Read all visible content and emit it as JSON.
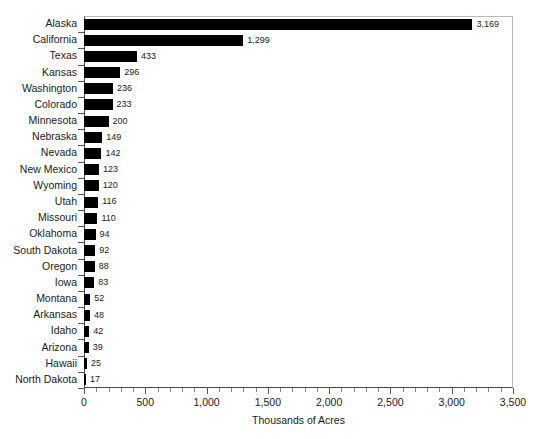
{
  "chart_data": {
    "type": "bar",
    "orientation": "horizontal",
    "title": "",
    "xlabel": "Thousands of Acres",
    "ylabel": "",
    "xlim": [
      0,
      3500
    ],
    "xticks": [
      "0",
      "500",
      "1,000",
      "1,500",
      "2,000",
      "2,500",
      "3,000",
      "3,500"
    ],
    "xtick_values": [
      0,
      500,
      1000,
      1500,
      2000,
      2500,
      3000,
      3500
    ],
    "minor_tick_interval": 100,
    "grid": false,
    "legend": null,
    "bar_color": "#000000",
    "categories": [
      "Alaska",
      "California",
      "Texas",
      "Kansas",
      "Washington",
      "Colorado",
      "Minnesota",
      "Nebraska",
      "Nevada",
      "New Mexico",
      "Wyoming",
      "Utah",
      "Missouri",
      "Oklahoma",
      "South Dakota",
      "Oregon",
      "Iowa",
      "Montana",
      "Arkansas",
      "Idaho",
      "Arizona",
      "Hawaii",
      "North Dakota"
    ],
    "values": [
      3169,
      1299,
      433,
      296,
      236,
      233,
      200,
      149,
      142,
      123,
      120,
      116,
      110,
      94,
      92,
      88,
      83,
      52,
      48,
      42,
      39,
      25,
      17
    ],
    "value_labels": [
      "3,169",
      "1,299",
      "433",
      "296",
      "236",
      "233",
      "200",
      "149",
      "142",
      "123",
      "120",
      "116",
      "110",
      "94",
      "92",
      "88",
      "83",
      "52",
      "48",
      "42",
      "39",
      "25",
      "17"
    ]
  }
}
